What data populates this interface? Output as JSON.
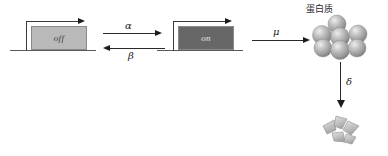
{
  "diagram": {
    "title_visible": false,
    "gene_off": {
      "label": "off",
      "box_color": "#b9b9b9",
      "text_color": "#3c3c3c"
    },
    "gene_on": {
      "label": "on",
      "box_color": "#676767",
      "text_color": "#e8e8e8"
    },
    "rates": {
      "activation": "α",
      "deactivation": "β",
      "production": "μ",
      "degradation": "δ"
    },
    "protein": {
      "label": "蛋白质",
      "sphere_color": "#a8a8a8",
      "sphere_count": 7
    },
    "degraded": {
      "fragment_color": "#c4c4c4",
      "fragment_count": 4
    },
    "line_color": "#3a3a3a",
    "dna_color": "#5a5a5a"
  }
}
